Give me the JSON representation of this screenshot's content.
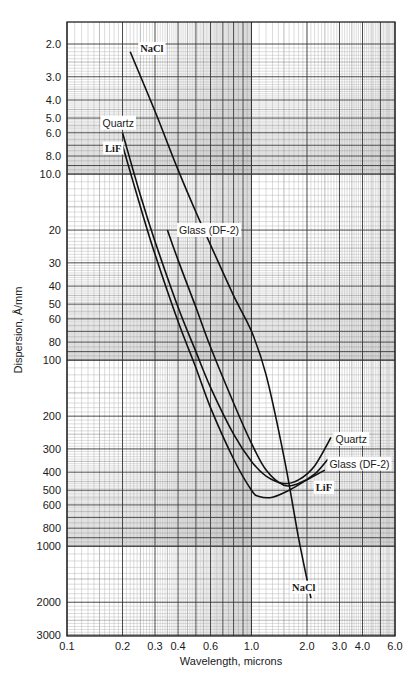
{
  "chart_data": {
    "type": "line",
    "title": "",
    "xlabel": "Wavelength, microns",
    "ylabel": "Dispersion, Å/mm",
    "xscale": "log",
    "yscale": "log",
    "y_inverted": true,
    "xlim": [
      0.1,
      6.0
    ],
    "ylim": [
      2.0,
      3000
    ],
    "grid": true,
    "legend": "inline labels",
    "x_ticks": [
      {
        "v": 0.1,
        "label": "0.1"
      },
      {
        "v": 0.2,
        "label": "0.2"
      },
      {
        "v": 0.3,
        "label": "0.3"
      },
      {
        "v": 0.4,
        "label": "0.4"
      },
      {
        "v": 0.6,
        "label": "0.6"
      },
      {
        "v": 1.0,
        "label": "1.0"
      },
      {
        "v": 2.0,
        "label": "2.0"
      },
      {
        "v": 3.0,
        "label": "3.0"
      },
      {
        "v": 4.0,
        "label": "4.0"
      },
      {
        "v": 6.0,
        "label": "6.0"
      }
    ],
    "y_ticks": [
      {
        "v": 2,
        "label": "2.0"
      },
      {
        "v": 3,
        "label": "3.0"
      },
      {
        "v": 4,
        "label": "4.0"
      },
      {
        "v": 5,
        "label": "5.0"
      },
      {
        "v": 6,
        "label": "6.0"
      },
      {
        "v": 8,
        "label": "8.0"
      },
      {
        "v": 10,
        "label": "10.0"
      },
      {
        "v": 20,
        "label": "20"
      },
      {
        "v": 30,
        "label": "30"
      },
      {
        "v": 40,
        "label": "40"
      },
      {
        "v": 50,
        "label": "50"
      },
      {
        "v": 60,
        "label": "60"
      },
      {
        "v": 80,
        "label": "80"
      },
      {
        "v": 100,
        "label": "100"
      },
      {
        "v": 200,
        "label": "200"
      },
      {
        "v": 300,
        "label": "300"
      },
      {
        "v": 400,
        "label": "400"
      },
      {
        "v": 500,
        "label": "500"
      },
      {
        "v": 600,
        "label": "600"
      },
      {
        "v": 800,
        "label": "800"
      },
      {
        "v": 1000,
        "label": "1000"
      },
      {
        "v": 2000,
        "label": "2000"
      },
      {
        "v": 3000,
        "label": "3000"
      }
    ],
    "series": [
      {
        "name": "NaCl",
        "label_font": "serif",
        "x": [
          0.22,
          0.3,
          0.4,
          0.5,
          0.6,
          0.8,
          1.0,
          1.2,
          1.5,
          1.8,
          2.1
        ],
        "y": [
          2.2,
          4.6,
          9.5,
          16,
          24,
          45,
          70,
          120,
          330,
          900,
          1900
        ],
        "label_pos": {
          "x": 0.24,
          "y": 2.1
        },
        "label_end": {
          "x": 1.6,
          "y": 1650
        }
      },
      {
        "name": "Quartz",
        "label_font": "sans",
        "x": [
          0.2,
          0.25,
          0.3,
          0.4,
          0.5,
          0.6,
          0.8,
          1.0,
          1.2,
          1.5,
          1.8,
          2.2,
          2.7
        ],
        "y": [
          6.0,
          13,
          23,
          52,
          90,
          140,
          250,
          350,
          420,
          460,
          440,
          370,
          260
        ],
        "label_pos": {
          "x": 0.15,
          "y": 5.3
        },
        "label_end": {
          "x": 2.75,
          "y": 265
        }
      },
      {
        "name": "LiF",
        "label_font": "serif",
        "x": [
          0.2,
          0.25,
          0.3,
          0.4,
          0.5,
          0.6,
          0.8,
          1.0,
          1.1,
          1.3,
          1.6,
          2.0,
          2.5
        ],
        "y": [
          7.0,
          15,
          27,
          62,
          110,
          180,
          340,
          500,
          540,
          545,
          500,
          440,
          390
        ],
        "label_pos": {
          "x": 0.155,
          "y": 7.2
        },
        "label_end": {
          "x": 2.15,
          "y": 480
        }
      },
      {
        "name": "Glass (DF-2)",
        "label_font": "sans",
        "x": [
          0.35,
          0.4,
          0.5,
          0.6,
          0.8,
          1.0,
          1.2,
          1.5,
          1.8,
          2.2,
          2.6
        ],
        "y": [
          20,
          29,
          52,
          85,
          170,
          280,
          390,
          470,
          460,
          410,
          340
        ],
        "label_pos": {
          "x": 0.39,
          "y": 20
        },
        "label_end": {
          "x": 2.55,
          "y": 360
        }
      }
    ]
  },
  "caption_partial": "(cropped caption text cut off at bottom edge)"
}
